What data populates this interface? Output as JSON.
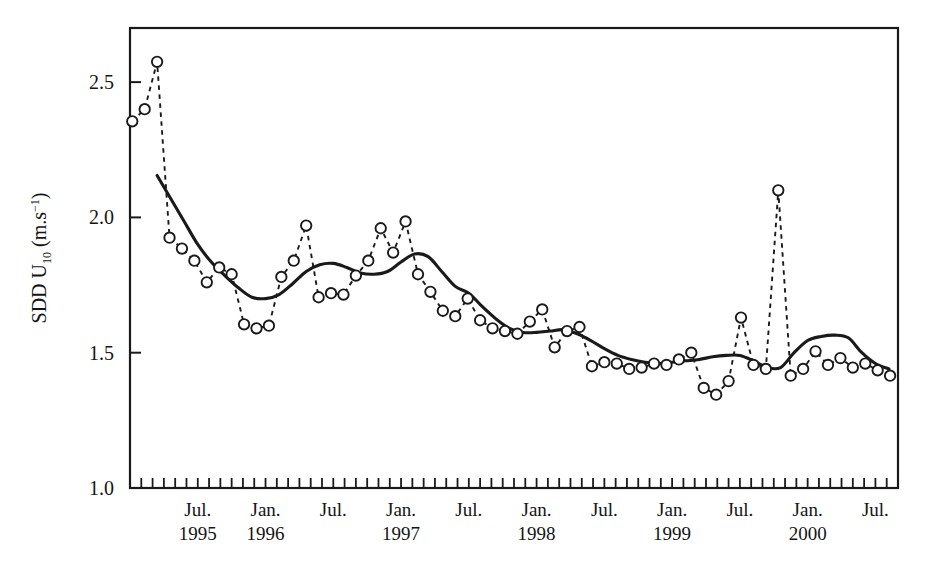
{
  "chart_data": {
    "type": "line",
    "title": "",
    "xlabel": "",
    "ylabel": "SDD U10 (m.s-1)",
    "ylabel_parts": {
      "main_a": "SDD U",
      "sub": "10",
      "main_b": " (m.s",
      "sup": "−1",
      "main_c": ")"
    },
    "ylim": [
      1.0,
      2.7
    ],
    "yticks": [
      1.0,
      1.5,
      2.0,
      2.5
    ],
    "ytick_labels": [
      "1.0",
      "1.5",
      "2.0",
      "2.5"
    ],
    "xlim_months": [
      0,
      68
    ],
    "x_tick_interval_months": 1,
    "grid": false,
    "legend": null,
    "frame": "box",
    "xtick_labels": [
      {
        "month_index": 6,
        "month": "Jul.",
        "year": "1995"
      },
      {
        "month_index": 12,
        "month": "Jan.",
        "year": "1996"
      },
      {
        "month_index": 18,
        "month": "Jul.",
        "year": ""
      },
      {
        "month_index": 24,
        "month": "Jan.",
        "year": "1997"
      },
      {
        "month_index": 30,
        "month": "Jul.",
        "year": ""
      },
      {
        "month_index": 36,
        "month": "Jan.",
        "year": "1998"
      },
      {
        "month_index": 42,
        "month": "Jul.",
        "year": ""
      },
      {
        "month_index": 48,
        "month": "Jan.",
        "year": "1999"
      },
      {
        "month_index": 54,
        "month": "Jul.",
        "year": ""
      },
      {
        "month_index": 60,
        "month": "Jan.",
        "year": "2000"
      },
      {
        "month_index": 66,
        "month": "Jul.",
        "year": ""
      }
    ],
    "series": [
      {
        "name": "monthly SDD U10",
        "style": "dashed-with-open-circles",
        "marker": "open-circle",
        "color": "#1a1a1a",
        "x": [
          0.2,
          1.3,
          2.4,
          3.5,
          4.6,
          5.7,
          6.8,
          7.9,
          9.0,
          10.1,
          11.2,
          12.3,
          13.4,
          14.5,
          15.6,
          16.7,
          17.8,
          18.9,
          20.0,
          21.1,
          22.2,
          23.3,
          24.4,
          25.5,
          26.6,
          27.7,
          28.8,
          29.9,
          31.0,
          32.1,
          33.2,
          34.3,
          35.4,
          36.5,
          37.6,
          38.7,
          39.8,
          40.9,
          42.0,
          43.1,
          44.2,
          45.3,
          46.4,
          47.5,
          48.6,
          49.7,
          50.8,
          51.9,
          53.0,
          54.1,
          55.2,
          56.3,
          57.4,
          58.5,
          59.6,
          60.7,
          61.8,
          62.9,
          64.0,
          65.1,
          66.2,
          67.3
        ],
        "values": [
          2.355,
          2.4,
          2.575,
          1.925,
          1.885,
          1.84,
          1.76,
          1.815,
          1.79,
          1.605,
          1.59,
          1.6,
          1.78,
          1.84,
          1.97,
          1.705,
          1.72,
          1.715,
          1.785,
          1.84,
          1.96,
          1.87,
          1.985,
          1.79,
          1.725,
          1.655,
          1.635,
          1.7,
          1.62,
          1.59,
          1.58,
          1.57,
          1.615,
          1.66,
          1.52,
          1.58,
          1.595,
          1.45,
          1.465,
          1.46,
          1.44,
          1.445,
          1.46,
          1.455,
          1.475,
          1.5,
          1.37,
          1.345,
          1.395,
          1.63,
          1.455,
          1.44,
          2.1,
          1.415,
          1.44,
          1.505,
          1.455,
          1.48,
          1.445,
          1.46,
          1.435,
          1.415
        ]
      },
      {
        "name": "smoothed trend",
        "style": "solid",
        "color": "#1a1a1a",
        "x": [
          2.4,
          3.6,
          4.8,
          6.0,
          7.2,
          8.4,
          9.6,
          10.8,
          12.0,
          13.2,
          14.4,
          15.6,
          16.8,
          18.0,
          19.2,
          20.4,
          21.6,
          22.8,
          24.0,
          25.2,
          26.4,
          27.6,
          28.8,
          30.0,
          31.2,
          32.4,
          33.6,
          34.8,
          36.0,
          37.2,
          38.4,
          39.6,
          40.8,
          42.0,
          43.2,
          44.4,
          45.6,
          46.8,
          48.0,
          49.2,
          50.4,
          51.6,
          52.8,
          54.0,
          55.2,
          56.4,
          57.6,
          58.8,
          60.0,
          61.2,
          62.4,
          63.6,
          64.8,
          66.0,
          67.2
        ],
        "values": [
          2.155,
          2.07,
          1.985,
          1.9,
          1.835,
          1.785,
          1.74,
          1.705,
          1.7,
          1.715,
          1.755,
          1.8,
          1.825,
          1.83,
          1.815,
          1.795,
          1.79,
          1.8,
          1.835,
          1.865,
          1.855,
          1.8,
          1.745,
          1.72,
          1.67,
          1.625,
          1.59,
          1.575,
          1.575,
          1.58,
          1.585,
          1.57,
          1.545,
          1.515,
          1.49,
          1.475,
          1.465,
          1.46,
          1.465,
          1.47,
          1.475,
          1.485,
          1.49,
          1.49,
          1.47,
          1.445,
          1.445,
          1.5,
          1.545,
          1.56,
          1.565,
          1.555,
          1.5,
          1.46,
          1.44
        ]
      }
    ]
  },
  "axes": {
    "plot_left_px": 130,
    "plot_right_px": 898,
    "plot_top_px": 28,
    "plot_bottom_px": 488
  }
}
